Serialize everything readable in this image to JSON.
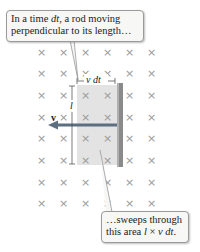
{
  "callout_top": {
    "line1_pre": "In a time ",
    "line1_var": "dt",
    "line1_post": ", a rod moving",
    "line2": "perpendicular to its length…"
  },
  "callout_bottom": {
    "line1": "…sweeps through",
    "line2_pre": "this area ",
    "line2_l": "l",
    "line2_times": " × ",
    "line2_vdt": "v dt",
    "line2_end": "."
  },
  "labels": {
    "width": "v dt",
    "length": "l",
    "velocity": "v"
  },
  "field": {
    "symbol": "×",
    "columns": [
      41,
      63,
      85,
      107,
      129,
      151
    ],
    "rows": [
      52,
      73,
      95,
      117,
      138,
      160,
      182,
      203
    ]
  },
  "colors": {
    "swept_area": "#e3e3e3",
    "rod": "#8a8a8a",
    "arrow": "#5c6f80",
    "cross": "#9a9a9a"
  }
}
